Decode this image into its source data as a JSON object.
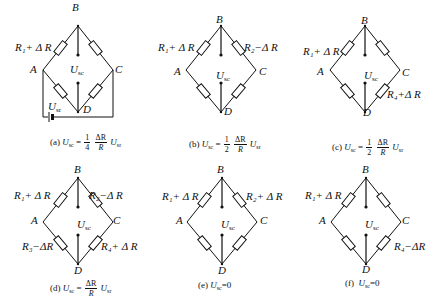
{
  "nodes": {
    "a": "A",
    "b": "B",
    "c": "C",
    "d": "D"
  },
  "output_voltage": {
    "symbol": "U",
    "sub": "sc"
  },
  "input_voltage": {
    "symbol": "U",
    "sub": "sr"
  },
  "panels": [
    {
      "id": "a",
      "labels": {
        "r_ab": "R₁+ Δ R",
        "r_bc": "",
        "r_ad": "",
        "r_dc": ""
      },
      "has_source": true,
      "caption": {
        "tag": "(a)",
        "lhs": "U",
        "lhs_sub": "sc",
        "eq": "=",
        "coef_num": "1",
        "coef_den": "4",
        "frac_num": "ΔR",
        "frac_den": "R",
        "rhs": "U",
        "rhs_sub": "sr"
      }
    },
    {
      "id": "b",
      "labels": {
        "r_ab": "R₁+ Δ R",
        "r_bc": "R₂−Δ R",
        "r_ad": "",
        "r_dc": ""
      },
      "has_source": false,
      "caption": {
        "tag": "(b)",
        "lhs": "U",
        "lhs_sub": "sc",
        "eq": "=",
        "coef_num": "1",
        "coef_den": "2",
        "frac_num": "ΔR",
        "frac_den": "R",
        "rhs": "U",
        "rhs_sub": "sr"
      }
    },
    {
      "id": "c",
      "labels": {
        "r_ab": "R₁+ Δ R",
        "r_bc": "",
        "r_ad": "",
        "r_dc": "R₄+Δ R"
      },
      "has_source": false,
      "caption": {
        "tag": "(c)",
        "lhs": "U",
        "lhs_sub": "sc",
        "eq": "=",
        "coef_num": "1",
        "coef_den": "2",
        "frac_num": "ΔR",
        "frac_den": "R",
        "rhs": "U",
        "rhs_sub": "sr"
      }
    },
    {
      "id": "d",
      "labels": {
        "r_ab": "R₁+ Δ R",
        "r_bc": "R₂−Δ R",
        "r_ad": "R₃−ΔR",
        "r_dc": "R₄+ Δ R"
      },
      "has_source": false,
      "caption": {
        "tag": "(d)",
        "lhs": "U",
        "lhs_sub": "sc",
        "eq": "=",
        "frac_num": "ΔR",
        "frac_den": "R",
        "rhs": "U",
        "rhs_sub": "sr"
      }
    },
    {
      "id": "e",
      "labels": {
        "r_ab": "R₁+ Δ R",
        "r_bc": "R₂+ Δ R",
        "r_ad": "",
        "r_dc": ""
      },
      "has_source": false,
      "caption": {
        "tag": "(e)",
        "lhs": "U",
        "lhs_sub": "sc",
        "eq": "=0"
      }
    },
    {
      "id": "f",
      "labels": {
        "r_ab": "R₁+ Δ R",
        "r_bc": "",
        "r_ad": "",
        "r_dc": "R₄−ΔR"
      },
      "has_source": false,
      "caption": {
        "tag": "(f)",
        "lhs": "U",
        "lhs_sub": "sc",
        "eq": "=0"
      }
    }
  ]
}
